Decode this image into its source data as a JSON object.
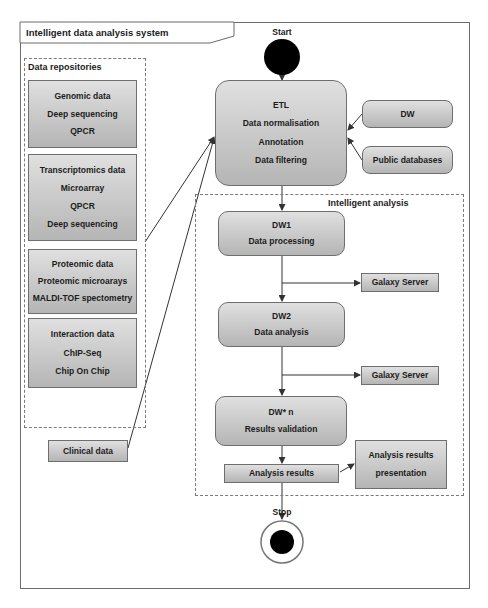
{
  "system": {
    "title": "Intelligent data analysis system"
  },
  "start": {
    "label": "Start"
  },
  "stop": {
    "label": "Stop"
  },
  "repositories": {
    "label": "Data repositories",
    "boxes": [
      {
        "lines": [
          "Genomic data",
          "Deep sequencing",
          "QPCR"
        ]
      },
      {
        "lines": [
          "Transcriptomics data",
          "Microarray",
          "QPCR",
          "Deep sequencing"
        ]
      },
      {
        "lines": [
          "Proteomic data",
          "Proteomic microarays",
          "MALDI-TOF spectometry"
        ]
      },
      {
        "lines": [
          "Interaction data",
          "ChIP-Seq",
          "Chip On Chip"
        ]
      }
    ]
  },
  "clinical": {
    "label": "Clinical data"
  },
  "etl": {
    "lines": [
      "ETL",
      "Data normalisation",
      "Annotation",
      "Data filtering"
    ]
  },
  "sources": {
    "dw": "DW",
    "public": "Public databases"
  },
  "analysis": {
    "label": "Intelligent analysis",
    "dw1": {
      "lines": [
        "DW1",
        "Data processing"
      ]
    },
    "galaxy1": "Galaxy Server",
    "dw2": {
      "lines": [
        "DW2",
        "Data analysis"
      ]
    },
    "galaxy2": "Galaxy Server",
    "dwn": {
      "lines": [
        "DW* n",
        "Results validation"
      ]
    },
    "results": "Analysis results",
    "presentation": {
      "lines": [
        "Analysis results",
        "presentation"
      ]
    }
  },
  "colors": {
    "box_fill_top": "#e0e0e0",
    "box_fill_bottom": "#b5b5b5",
    "border": "#6e6e6e",
    "node": "#000000"
  }
}
